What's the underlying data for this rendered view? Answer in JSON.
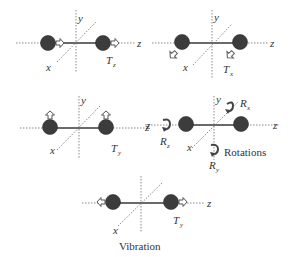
{
  "figure": {
    "panels": [
      {
        "id": "translation-z",
        "mode_label": "T",
        "mode_sub": "z",
        "axis_labels": {
          "x": "x",
          "y": "y",
          "z": "z"
        }
      },
      {
        "id": "translation-x",
        "mode_label": "T",
        "mode_sub": "x",
        "axis_labels": {
          "x": "x",
          "y": "y",
          "z": "z"
        }
      },
      {
        "id": "translation-y",
        "mode_label": "T",
        "mode_sub": "y",
        "axis_labels": {
          "x": "x",
          "y": "y",
          "z": "z"
        }
      },
      {
        "id": "rotations",
        "caption": "Rotations",
        "axis_labels": {
          "x": "x",
          "y": "y",
          "z_left": "z",
          "z_right": "z"
        },
        "rot_x": {
          "label": "R",
          "sub": "x"
        },
        "rot_y": {
          "label": "R",
          "sub": "y"
        },
        "rot_z": {
          "label": "R",
          "sub": "z"
        }
      },
      {
        "id": "vibration",
        "caption": "Vibration",
        "mode_label": "T",
        "mode_sub": "y",
        "axis_labels": {
          "x": "x",
          "z": "z"
        }
      }
    ]
  },
  "colors": {
    "atom": "#3c3c3c",
    "bond": "#6a6a6a",
    "axis": "#8a8a8a",
    "arrow_fill": "#ffffff"
  }
}
